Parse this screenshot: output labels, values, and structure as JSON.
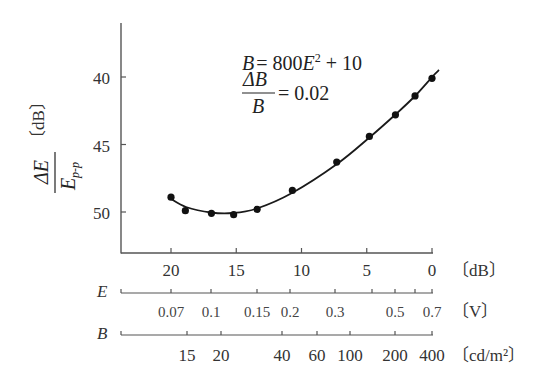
{
  "chart_data": {
    "type": "line",
    "title": "",
    "annotations": {
      "equation": {
        "lhs": "B",
        "eq": "=",
        "rhs_prefix": "800",
        "var": "E",
        "exp": "2",
        "rhs_suffix": "+ 10"
      },
      "ratio": {
        "num": "ΔB",
        "den": "B",
        "eq": "= 0.02"
      }
    },
    "ylabel": {
      "num": "ΔE",
      "den": "E",
      "den_sub": "p-p",
      "unit": "〔dB〕"
    },
    "y_axis": {
      "ticks": [
        40,
        45,
        50
      ],
      "inverted": true,
      "range": [
        36.5,
        51.8
      ]
    },
    "x_axes": [
      {
        "name": "",
        "unit": "〔dB〕",
        "ticks": [
          20,
          15,
          10,
          5,
          0
        ],
        "tick_labels": [
          "20",
          "15",
          "10",
          "5",
          "0"
        ],
        "range_dB": [
          23.7,
          0
        ]
      },
      {
        "name": "E",
        "unit": "〔V〕",
        "ticks": [
          0.07,
          0.1,
          0.15,
          0.2,
          0.3,
          0.4,
          0.5,
          0.6,
          0.7
        ],
        "tick_labels": [
          "0.07",
          "0.1",
          "0.15",
          "0.2",
          "0.3",
          "",
          "0.5",
          "",
          "0.7"
        ]
      },
      {
        "name": "B",
        "unit": "〔cd/m²〕",
        "ticks": [
          15,
          20,
          40,
          60,
          100,
          200,
          400
        ],
        "tick_labels": [
          "15",
          "20",
          "40",
          "60",
          "100",
          "200",
          "400"
        ]
      }
    ],
    "series": [
      {
        "name": "measured",
        "marker": "filled-circle",
        "x_dB": [
          20.0,
          18.9,
          16.9,
          15.2,
          13.4,
          10.7,
          7.3,
          4.8,
          2.8,
          1.3,
          0.0
        ],
        "y_dB": [
          48.9,
          49.9,
          50.1,
          50.2,
          49.8,
          48.4,
          46.3,
          44.4,
          42.8,
          41.4,
          40.1
        ]
      }
    ],
    "grid": false,
    "legend": null
  }
}
